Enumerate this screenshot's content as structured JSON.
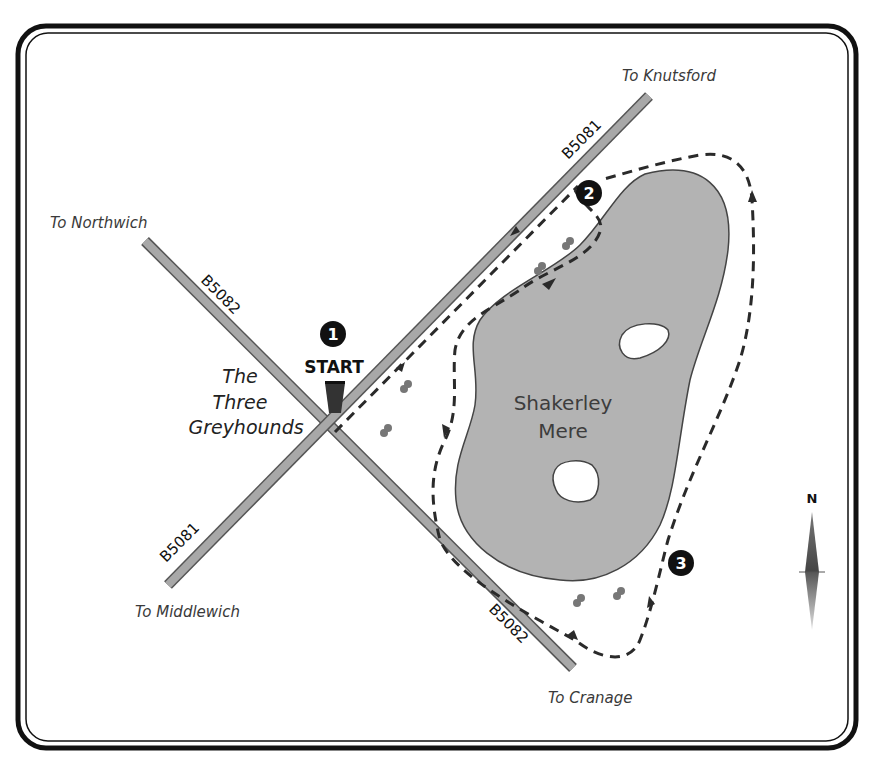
{
  "map": {
    "title": "Shakerley Mere walk",
    "colors": {
      "frame": "#111111",
      "road_fill": "#a8a8a8",
      "road_edge": "#555555",
      "lake_fill": "#b3b3b3",
      "lake_edge": "#444444",
      "route": "#2a2a2a",
      "waypoint": "#111111",
      "tree": "#777777"
    },
    "destinations": {
      "northwich": "To Northwich",
      "knutsford": "To Knutsford",
      "middlewich": "To Middlewich",
      "cranage": "To Cranage"
    },
    "roads": {
      "b5082_north": "B5082",
      "b5082_south": "B5082",
      "b5081_north": "B5081",
      "b5081_south": "B5081"
    },
    "pub": {
      "line1": "The",
      "line2": "Three",
      "line3": "Greyhounds"
    },
    "lake": {
      "line1": "Shakerley",
      "line2": "Mere"
    },
    "start": {
      "label": "START",
      "waypoint": "1"
    },
    "waypoints": [
      {
        "id": "1",
        "label": "1"
      },
      {
        "id": "2",
        "label": "2"
      },
      {
        "id": "3",
        "label": "3"
      }
    ],
    "compass": {
      "label": "N"
    }
  }
}
